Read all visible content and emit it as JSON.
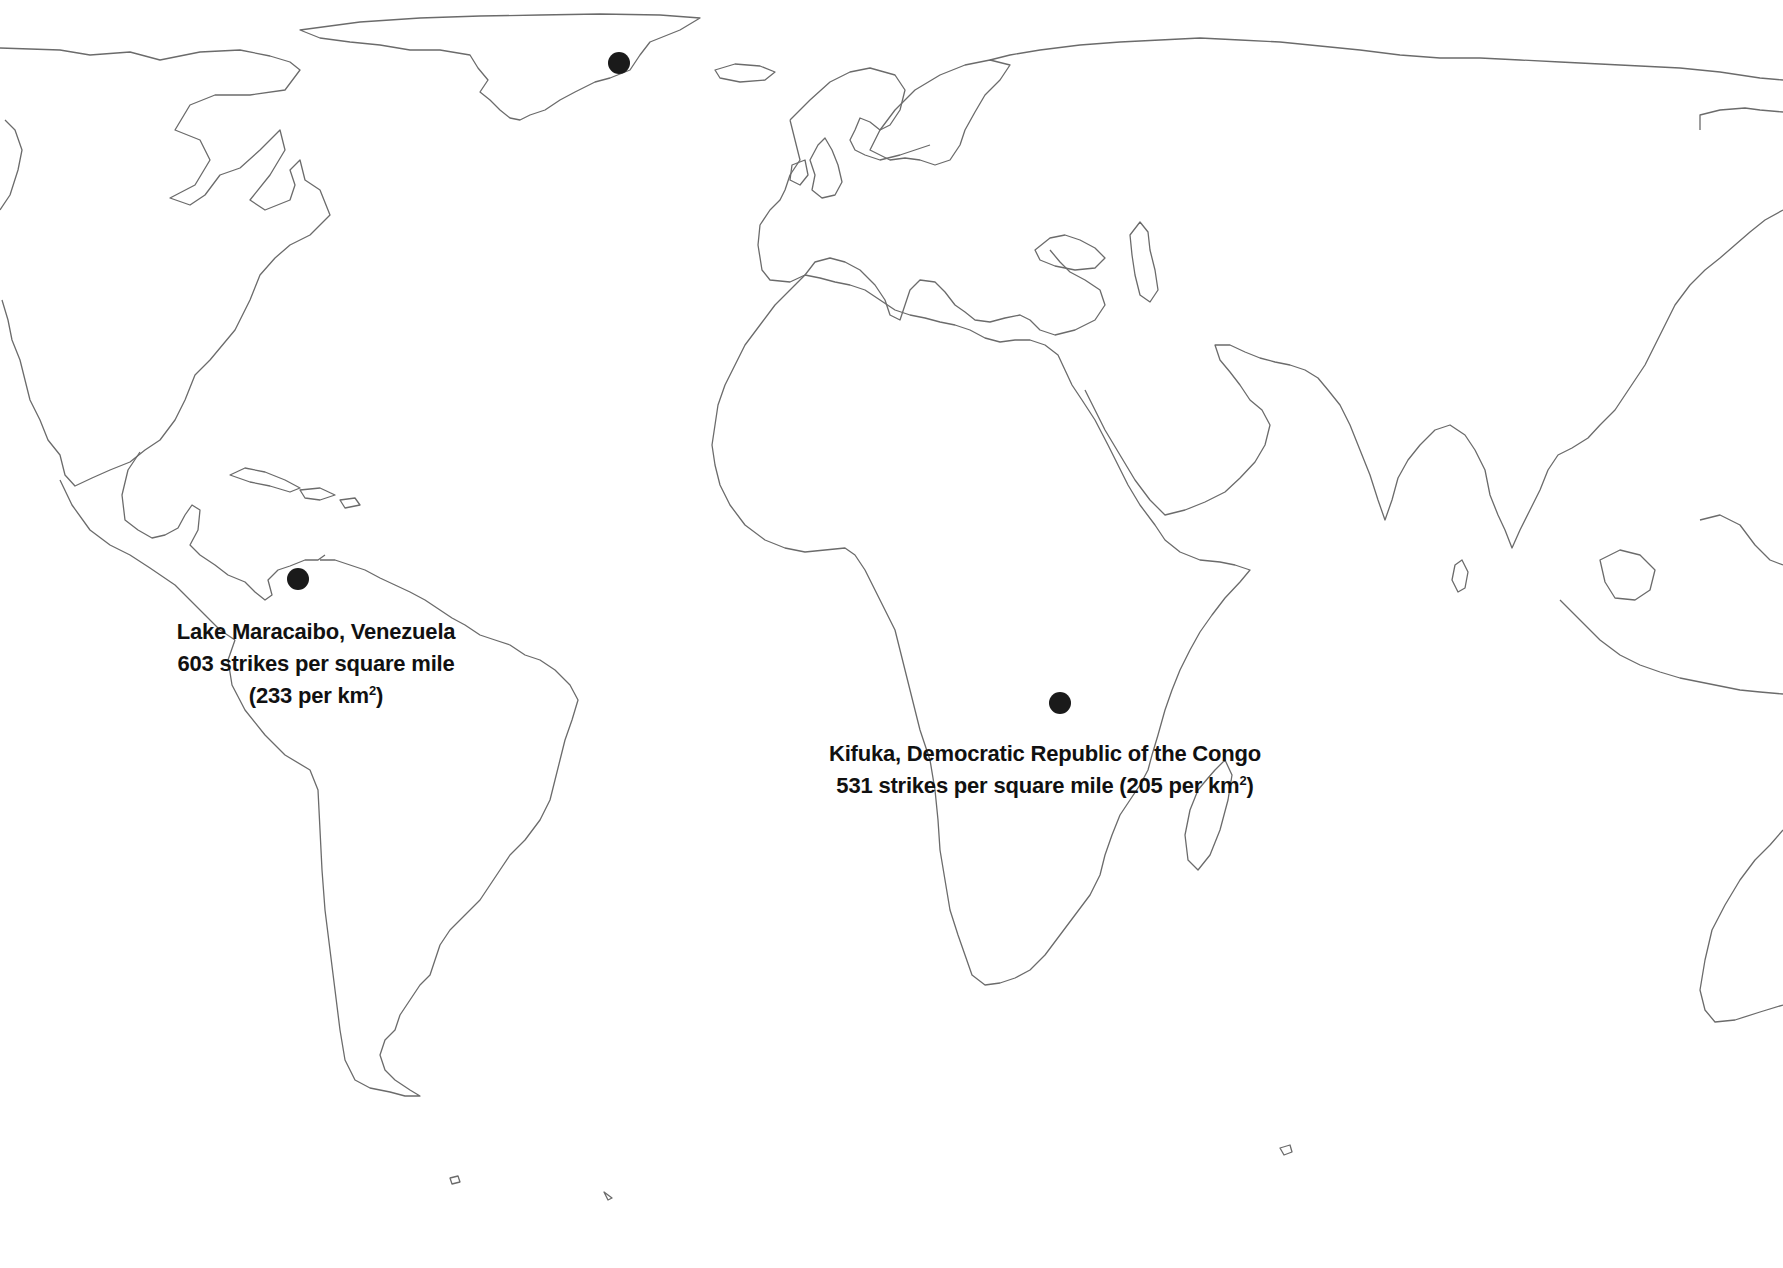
{
  "map": {
    "title": "World lightning hotspots",
    "projection": "equirectangular-style world outline",
    "colors": {
      "background": "#ffffff",
      "coastline": "#6b6b6b",
      "marker": "#1a1a1a",
      "text": "#111111"
    }
  },
  "markers": [
    {
      "id": "greenland",
      "label": "",
      "x": 619,
      "y": 63
    },
    {
      "id": "lake-maracaibo",
      "label": "Lake Maracaibo, Venezuela",
      "x": 298,
      "y": 579
    },
    {
      "id": "kifuka",
      "label": "Kifuka, Democratic Republic of the Congo",
      "x": 1060,
      "y": 703
    }
  ],
  "labels": {
    "maracaibo": {
      "line1": "Lake Maracaibo, Venezuela",
      "line2": "603 strikes per square mile",
      "line3_prefix": "(233 per km",
      "line3_sup": "2",
      "line3_suffix": ")"
    },
    "kifuka": {
      "line1": "Kifuka, Democratic Republic of the Congo",
      "line2_prefix": "531 strikes per square mile (205 per km",
      "line2_sup": "2",
      "line2_suffix": ")"
    }
  }
}
